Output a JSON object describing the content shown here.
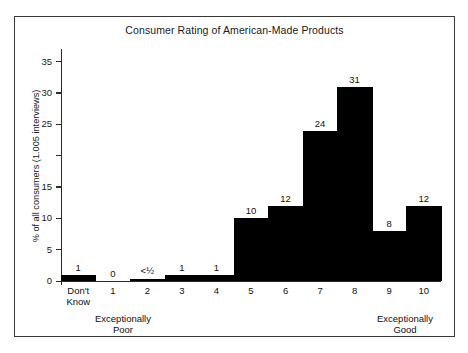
{
  "chart_data": {
    "type": "bar",
    "title": "Consumer Rating of American-Made Products",
    "xlabel": "",
    "ylabel": "% of all consumers (1.005 interviews)",
    "categories": [
      "Don't Know",
      "1",
      "2",
      "3",
      "4",
      "5",
      "6",
      "7",
      "8",
      "9",
      "10"
    ],
    "values": [
      1,
      0,
      0.4,
      1,
      1,
      10,
      12,
      24,
      31,
      8,
      12
    ],
    "value_labels": [
      "1",
      "0",
      "<½",
      "1",
      "1",
      "10",
      "12",
      "24",
      "31",
      "8",
      "12"
    ],
    "ylim": [
      0,
      37
    ],
    "ytick_labels": [
      "0",
      "5",
      "10",
      "15",
      "",
      "25",
      "30",
      "35"
    ],
    "ytick_values": [
      0,
      5,
      10,
      15,
      20,
      25,
      30,
      35
    ],
    "grid": false,
    "legend": "none",
    "bar_color": "#000000",
    "annotations": [
      {
        "text_line1": "Exceptionally",
        "text_line2": "Poor",
        "at_category": "1"
      },
      {
        "text_line1": "Exceptionally",
        "text_line2": "Good",
        "at_category": "10"
      }
    ],
    "xlabel_line2": {
      "Don't Know": "Know"
    }
  },
  "chart": {
    "title": "Consumer Rating of American-Made Products",
    "y_axis_title": "% of all consumers (1.005 interviews)",
    "anchor_low_l1": "Exceptionally",
    "anchor_low_l2": "Poor",
    "anchor_high_l1": "Exceptionally",
    "anchor_high_l2": "Good",
    "dont_know_l1": "Don't",
    "dont_know_l2": "Know"
  }
}
